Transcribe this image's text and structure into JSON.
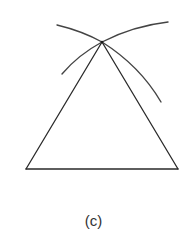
{
  "figure": {
    "caption": "(c)",
    "stroke_color": "#2a2a2a",
    "arc_color": "#444444",
    "background": "#ffffff",
    "points": {
      "apex": [
        102,
        42
      ],
      "base_left": [
        26,
        169
      ],
      "base_right": [
        178,
        169
      ]
    },
    "arcs": [
      {
        "name": "arc-from-base-left",
        "from": [
          57,
          25
        ],
        "via": [
          80,
          32
        ],
        "to": [
          102,
          42
        ],
        "continues_to": [
          161,
          102
        ]
      },
      {
        "name": "arc-from-base-right",
        "from": [
          168,
          22
        ],
        "via": [
          135,
          26
        ],
        "to": [
          102,
          42
        ],
        "continues_to": [
          62,
          74
        ]
      }
    ],
    "segments": [
      {
        "name": "left-side",
        "from": "apex",
        "to": "base_left"
      },
      {
        "name": "right-side",
        "from": "apex",
        "to": "base_right"
      },
      {
        "name": "base",
        "from": "base_left",
        "to": "base_right"
      }
    ]
  }
}
